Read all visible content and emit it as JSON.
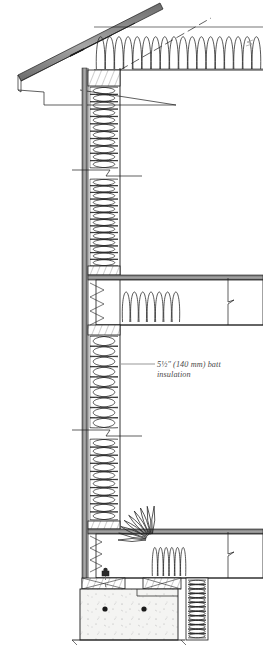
{
  "drawing": {
    "type": "architectural-wall-section",
    "title": "Insulated wood-frame wall section",
    "background_color": "#ffffff",
    "line_color": "#1a1a1a",
    "sheathing_color": "#8c8c8c",
    "insulation_color": "#2b2b2b",
    "concrete_fill": "#f2f2f0",
    "text_color": "#4a4a4a"
  },
  "annotations": [
    {
      "id": "batt-insulation-callout",
      "line1": "5½″ (140 mm) batt",
      "line2": "insulation",
      "leader_x1": 121,
      "leader_x2": 155,
      "leader_y": 364,
      "text_x": 157,
      "text_y1": 367,
      "text_y2": 377
    }
  ],
  "components": {
    "roof": {
      "name": "sloped-roof-plane",
      "label": "roof slope"
    },
    "eave": {
      "name": "eave-soffit-fascia",
      "label": "eave / soffit"
    },
    "attic": {
      "name": "attic-insulation",
      "label": "attic batt insulation",
      "loop_count": 18
    },
    "wall_upper": {
      "name": "upper-wall-cavity",
      "label": "upper storey wall batt insulation",
      "loop_count": 11
    },
    "wall_mid": {
      "name": "mid-wall-cavity",
      "label": "mid wall batt insulation",
      "loop_count": 13
    },
    "wall_lower": {
      "name": "lower-wall-cavity",
      "label": "lower storey wall batt insulation",
      "loop_count": 10
    },
    "floor_mid": {
      "name": "intermediate-floor-assembly",
      "label": "intermediate floor / rim joist"
    },
    "floor_lower": {
      "name": "ground-floor-assembly",
      "label": "ground floor / rim joist"
    },
    "foundation": {
      "name": "concrete-foundation-wall",
      "label": "concrete foundation wall",
      "anchor_bolt_count": 1,
      "rebar_dot_count": 2
    },
    "break_lines": [
      {
        "name": "break-line-upper-wall",
        "y": 172
      },
      {
        "name": "break-line-lower-wall",
        "y": 432
      },
      {
        "name": "break-line-mid-floor-right",
        "x": 228,
        "y": 303
      },
      {
        "name": "break-line-lower-floor-right",
        "x": 228,
        "y": 556
      },
      {
        "name": "break-line-attic-right",
        "x": 249,
        "y": 40
      }
    ]
  }
}
